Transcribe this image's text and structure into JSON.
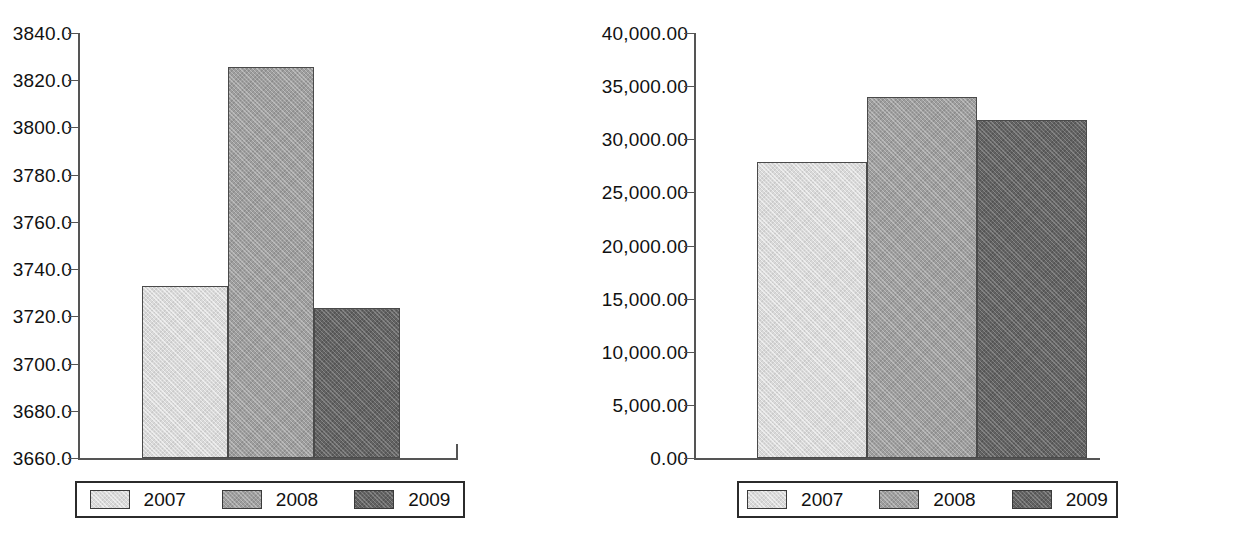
{
  "chart_data": [
    {
      "id": "left",
      "type": "bar",
      "title": "",
      "xlabel": "",
      "ylabel": "",
      "categories": [
        "2007",
        "2008",
        "2009"
      ],
      "values": [
        3733.0,
        3825.5,
        3723.5
      ],
      "ylim": [
        3660.0,
        3840.0
      ],
      "ytick_labels": [
        "3840.0",
        "3820.0",
        "3800.0",
        "3780.0",
        "3760.0",
        "3740.0",
        "3720.0",
        "3700.0",
        "3680.0",
        "3660.0"
      ],
      "ytick_values": [
        3840.0,
        3820.0,
        3800.0,
        3780.0,
        3760.0,
        3740.0,
        3720.0,
        3700.0,
        3680.0,
        3660.0
      ],
      "grid": false,
      "legend_position": "bottom",
      "legend": [
        {
          "label": "2007",
          "color": "#d9d9d9"
        },
        {
          "label": "2008",
          "color": "#9e9e9e"
        },
        {
          "label": "2009",
          "color": "#636363"
        }
      ]
    },
    {
      "id": "right",
      "type": "bar",
      "title": "",
      "xlabel": "",
      "ylabel": "",
      "categories": [
        "2007",
        "2008",
        "2009"
      ],
      "values": [
        27850.0,
        34000.0,
        31850.0
      ],
      "ylim": [
        0.0,
        40000.0
      ],
      "ytick_labels": [
        "40,000.00",
        "35,000.00",
        "30,000.00",
        "25,000.00",
        "20,000.00",
        "15,000.00",
        "10,000.00",
        "5,000.00",
        "0.00"
      ],
      "ytick_values": [
        40000,
        35000,
        30000,
        25000,
        20000,
        15000,
        10000,
        5000,
        0
      ],
      "grid": false,
      "legend_position": "bottom",
      "legend": [
        {
          "label": "2007",
          "color": "#d9d9d9"
        },
        {
          "label": "2008",
          "color": "#9e9e9e"
        },
        {
          "label": "2009",
          "color": "#636363"
        }
      ]
    }
  ],
  "colors": {
    "series_2007": "#d9d9d9",
    "series_2008": "#9e9e9e",
    "series_2009": "#636363",
    "axis": "#555555",
    "text": "#111111",
    "background": "#ffffff"
  }
}
